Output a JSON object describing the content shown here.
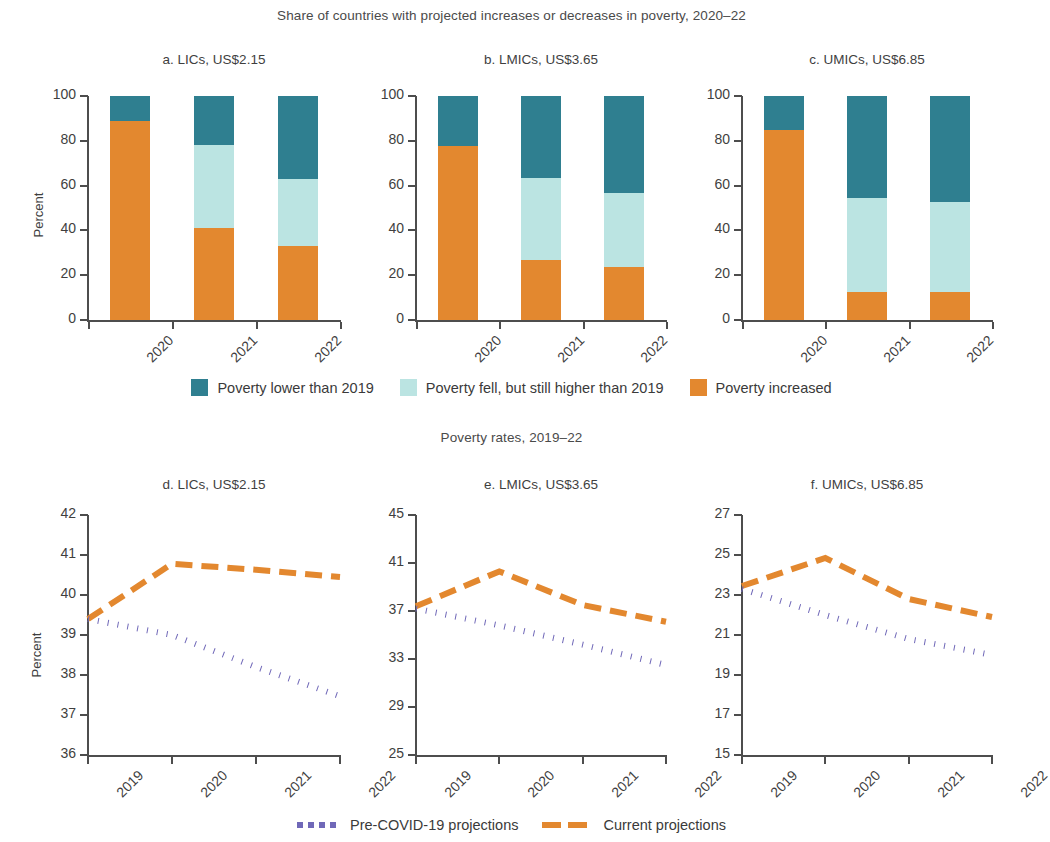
{
  "figure": {
    "top_section_title": "Share of countries with projected increases or decreases in poverty, 2020–22",
    "bottom_section_title": "Poverty rates, 2019–22",
    "y_axis_label": "Percent",
    "colors": {
      "teal": "#2f7f90",
      "light_blue": "#bbe4e2",
      "orange": "#e3882f",
      "purple": "#7068b8",
      "axis": "#4d4d4d",
      "text": "#3f3f3f"
    }
  },
  "bar_legend": {
    "items": [
      {
        "label": "Poverty lower than 2019",
        "color": "#2f7f90",
        "key": "teal-swatch"
      },
      {
        "label": "Poverty fell, but still higher than 2019",
        "color": "#bbe4e2",
        "key": "light-blue-swatch"
      },
      {
        "label": "Poverty increased",
        "color": "#e3882f",
        "key": "orange-swatch"
      }
    ]
  },
  "line_legend": {
    "items": [
      {
        "label": "Pre-COVID-19 projections",
        "color": "#7068b8",
        "style": "dotted"
      },
      {
        "label": "Current projections",
        "color": "#e3882f",
        "style": "dashed"
      }
    ]
  },
  "chart_data": [
    {
      "type": "bar",
      "id": "panel-a",
      "title": "a. LICs, US$2.15",
      "xlabel": "",
      "ylabel": "Percent",
      "ylim": [
        0,
        100
      ],
      "yticks": [
        0,
        20,
        40,
        60,
        80,
        100
      ],
      "grid": false,
      "stacked": true,
      "categories": [
        "2020",
        "2021",
        "2022"
      ],
      "series": [
        {
          "name": "Poverty increased",
          "color": "#e3882f",
          "values": [
            89,
            41,
            33
          ]
        },
        {
          "name": "Poverty fell, but still higher than 2019",
          "color": "#bbe4e2",
          "values": [
            0,
            37,
            30
          ]
        },
        {
          "name": "Poverty lower than 2019",
          "color": "#2f7f90",
          "values": [
            11,
            22,
            37
          ]
        }
      ]
    },
    {
      "type": "bar",
      "id": "panel-b",
      "title": "b. LMICs, US$3.65",
      "xlabel": "",
      "ylabel": "",
      "ylim": [
        0,
        100
      ],
      "yticks": [
        0,
        20,
        40,
        60,
        80,
        100
      ],
      "grid": false,
      "stacked": true,
      "categories": [
        "2020",
        "2021",
        "2022"
      ],
      "series": [
        {
          "name": "Poverty increased",
          "color": "#e3882f",
          "values": [
            77.5,
            27,
            23.5
          ]
        },
        {
          "name": "Poverty fell, but still higher than 2019",
          "color": "#bbe4e2",
          "values": [
            0,
            36.5,
            33
          ]
        },
        {
          "name": "Poverty lower than 2019",
          "color": "#2f7f90",
          "values": [
            22.5,
            36.5,
            43.5
          ]
        }
      ]
    },
    {
      "type": "bar",
      "id": "panel-c",
      "title": "c. UMICs, US$6.85",
      "xlabel": "",
      "ylabel": "",
      "ylim": [
        0,
        100
      ],
      "yticks": [
        0,
        20,
        40,
        60,
        80,
        100
      ],
      "grid": false,
      "stacked": true,
      "categories": [
        "2020",
        "2021",
        "2022"
      ],
      "series": [
        {
          "name": "Poverty increased",
          "color": "#e3882f",
          "values": [
            85,
            12.5,
            12.5
          ]
        },
        {
          "name": "Poverty fell, but still higher than 2019",
          "color": "#bbe4e2",
          "values": [
            0,
            42,
            40
          ]
        },
        {
          "name": "Poverty lower than 2019",
          "color": "#2f7f90",
          "values": [
            15,
            45.5,
            47.5
          ]
        }
      ]
    },
    {
      "type": "line",
      "id": "panel-d",
      "title": "d. LICs, US$2.15",
      "xlabel": "",
      "ylabel": "Percent",
      "x": [
        "2019",
        "2020",
        "2021",
        "2022"
      ],
      "ylim": [
        36,
        42
      ],
      "yticks": [
        36,
        37,
        38,
        39,
        40,
        41,
        42
      ],
      "grid": false,
      "series": [
        {
          "name": "Current projections",
          "color": "#e3882f",
          "style": "dashed",
          "values": [
            39.4,
            40.78,
            40.63,
            40.45
          ]
        },
        {
          "name": "Pre-COVID-19 projections",
          "color": "#7068b8",
          "style": "dotted",
          "values": [
            39.4,
            39.0,
            38.2,
            37.47
          ]
        }
      ]
    },
    {
      "type": "line",
      "id": "panel-e",
      "title": "e. LMICs, US$3.65",
      "xlabel": "",
      "ylabel": "",
      "x": [
        "2019",
        "2020",
        "2021",
        "2022"
      ],
      "ylim": [
        25,
        45
      ],
      "yticks": [
        25,
        29,
        33,
        37,
        41,
        45
      ],
      "grid": false,
      "series": [
        {
          "name": "Current projections",
          "color": "#e3882f",
          "style": "dashed",
          "values": [
            37.4,
            40.3,
            37.5,
            36.1
          ]
        },
        {
          "name": "Pre-COVID-19 projections",
          "color": "#7068b8",
          "style": "dotted",
          "values": [
            37.2,
            35.8,
            34.2,
            32.5
          ]
        }
      ]
    },
    {
      "type": "line",
      "id": "panel-f",
      "title": "f. UMICs, US$6.85",
      "xlabel": "",
      "ylabel": "",
      "x": [
        "2019",
        "2020",
        "2021",
        "2022"
      ],
      "ylim": [
        15,
        27
      ],
      "yticks": [
        15,
        17,
        19,
        21,
        23,
        25,
        27
      ],
      "grid": false,
      "series": [
        {
          "name": "Current projections",
          "color": "#e3882f",
          "style": "dashed",
          "values": [
            23.45,
            24.85,
            22.8,
            21.9
          ]
        },
        {
          "name": "Pre-COVID-19 projections",
          "color": "#7068b8",
          "style": "dotted",
          "values": [
            23.3,
            22.0,
            20.8,
            20.0
          ]
        }
      ]
    }
  ]
}
